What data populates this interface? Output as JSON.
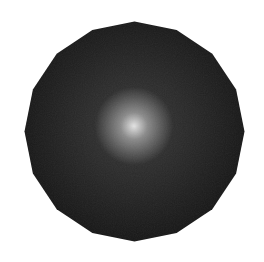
{
  "scene": {
    "subject": "shaded sphere",
    "shape": "polygon",
    "polygon_sides": 16,
    "colors": {
      "background": "#ffffff",
      "edge": "#171717",
      "mid": "#2e2e2e",
      "glow": "#8a8a8a",
      "highlight": "#e4e4e4"
    }
  }
}
